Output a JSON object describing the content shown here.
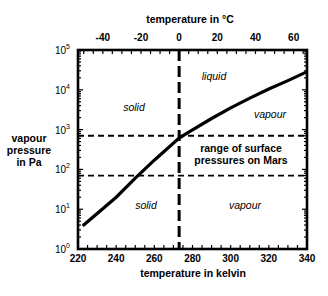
{
  "chart_data": {
    "type": "line",
    "title": "",
    "top_axis": {
      "label": "temperature in °C",
      "ticks": [
        -40,
        -20,
        0,
        20,
        40,
        60
      ],
      "tick_labels": [
        "-40",
        "-20",
        "0",
        "20",
        "40",
        "60"
      ]
    },
    "xlabel": "temperature in kelvin",
    "ylabel": [
      "vapour",
      "pressure",
      "in Pa"
    ],
    "xlim": [
      220,
      340
    ],
    "ylim": [
      1,
      100000
    ],
    "yscale": "log",
    "x_ticks": [
      220,
      240,
      260,
      280,
      300,
      320,
      340
    ],
    "x_tick_labels": [
      "220",
      "240",
      "260",
      "280",
      "300",
      "320",
      "340"
    ],
    "y_ticks": [
      1,
      10,
      100,
      1000,
      10000,
      100000
    ],
    "y_tick_labels": [
      {
        "base": "10",
        "exp": "0"
      },
      {
        "base": "10",
        "exp": "1"
      },
      {
        "base": "10",
        "exp": "2"
      },
      {
        "base": "10",
        "exp": "3"
      },
      {
        "base": "10",
        "exp": "4"
      },
      {
        "base": "10",
        "exp": "5"
      }
    ],
    "grid": false,
    "series": [
      {
        "name": "water vapour pressure curve",
        "x": [
          223,
          240,
          250,
          260,
          273,
          280,
          290,
          300,
          310,
          320,
          330,
          339
        ],
        "y": [
          4,
          20,
          60,
          170,
          610,
          990,
          1900,
          3500,
          6200,
          10500,
          17000,
          27000
        ]
      }
    ],
    "reference_lines": [
      {
        "orientation": "vertical",
        "x": 273,
        "style": "long-dash",
        "meaning": "0 °C"
      },
      {
        "orientation": "horizontal",
        "y": 700,
        "style": "dashed",
        "meaning": "upper Mars surface pressure"
      },
      {
        "orientation": "horizontal",
        "y": 70,
        "style": "dashed",
        "meaning": "lower Mars surface pressure"
      }
    ],
    "annotations": [
      {
        "text": "solid",
        "x": 245,
        "y": 3000
      },
      {
        "text": "liquid",
        "x": 290,
        "y": 30000
      },
      {
        "text": "vapour",
        "x": 320,
        "y": 3000
      },
      {
        "text": "range of surface",
        "x": 305,
        "y": 300
      },
      {
        "text": "pressures on Mars",
        "x": 305,
        "y": 180
      },
      {
        "text": "solid",
        "x": 253,
        "y": 8
      },
      {
        "text": "vapour",
        "x": 308,
        "y": 8
      }
    ]
  }
}
